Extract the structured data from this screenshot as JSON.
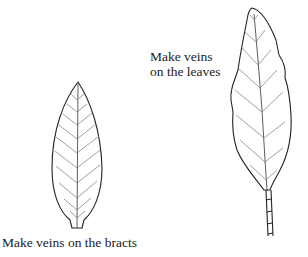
{
  "labels": {
    "leaves": [
      "Make veins",
      "on the leaves"
    ],
    "bracts": "Make veins on the bracts"
  },
  "figures": [
    {
      "name": "bract",
      "description": "Bract outline with pinnate veins"
    },
    {
      "name": "leaf",
      "description": "Leaf outline with pinnate veins and stem"
    }
  ],
  "colors": {
    "ink": "#222222",
    "background": "#ffffff"
  }
}
